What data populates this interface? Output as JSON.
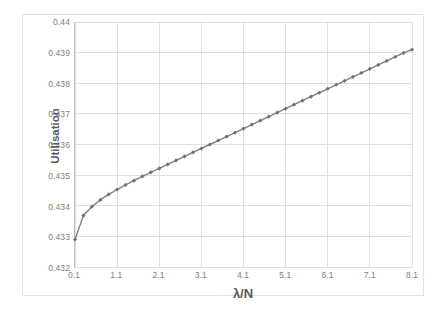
{
  "chart_data": {
    "type": "line",
    "title": "",
    "xlabel": "λ/N",
    "ylabel": "Utilisation",
    "xlim": [
      0.1,
      8.1
    ],
    "ylim": [
      0.432,
      0.44
    ],
    "grid": true,
    "legend": null,
    "xticks": [
      "0.1",
      "1.1",
      "2.1",
      "3.1",
      "4.1",
      "5.1",
      "6.1",
      "7.1",
      "8.1"
    ],
    "xtick_values": [
      0.1,
      1.1,
      2.1,
      3.1,
      4.1,
      5.1,
      6.1,
      7.1,
      8.1
    ],
    "yticks": [
      "0.432",
      "0.433",
      "0.434",
      "0.435",
      "0.436",
      "0.437",
      "0.438",
      "0.439",
      "0.44"
    ],
    "ytick_values": [
      0.432,
      0.433,
      0.434,
      0.435,
      0.436,
      0.437,
      0.438,
      0.439,
      0.44
    ],
    "series": [
      {
        "name": "Utilisation",
        "color": "#808080",
        "marker": "diamond",
        "marker_color": "#737373",
        "x": [
          0.1,
          0.3,
          0.5,
          0.7,
          0.9,
          1.1,
          1.3,
          1.5,
          1.7,
          1.9,
          2.1,
          2.3,
          2.5,
          2.7,
          2.9,
          3.1,
          3.3,
          3.5,
          3.7,
          3.9,
          4.1,
          4.3,
          4.5,
          4.7,
          4.9,
          5.1,
          5.3,
          5.5,
          5.7,
          5.9,
          6.1,
          6.3,
          6.5,
          6.7,
          6.9,
          7.1,
          7.3,
          7.5,
          7.7,
          7.9,
          8.1
        ],
        "y": [
          0.4329,
          0.43368,
          0.43397,
          0.43419,
          0.43437,
          0.43453,
          0.43468,
          0.43482,
          0.43496,
          0.43509,
          0.43522,
          0.43535,
          0.43548,
          0.43561,
          0.43574,
          0.43587,
          0.436,
          0.43613,
          0.43626,
          0.43639,
          0.43652,
          0.43665,
          0.43678,
          0.43691,
          0.43704,
          0.43717,
          0.4373,
          0.43743,
          0.43756,
          0.43769,
          0.43782,
          0.43795,
          0.43808,
          0.43821,
          0.43834,
          0.43847,
          0.4386,
          0.43873,
          0.43886,
          0.43899,
          0.4391
        ]
      }
    ]
  },
  "axis": {
    "x_title": "λ/N",
    "y_title": "Utilisation"
  },
  "colors": {
    "series_line": "#808080",
    "gridline": "#e0e0e0",
    "axis_line": "#bfbfbf",
    "tick_text": "#808080",
    "title_text": "#595959",
    "frame": "#e3e3e3",
    "background": "#ffffff"
  }
}
